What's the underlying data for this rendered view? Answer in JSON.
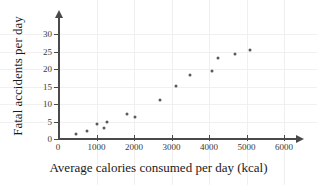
{
  "chart_data": {
    "type": "scatter",
    "title": "",
    "xlabel": "Average calories consumed per day (kcal)",
    "ylabel": "Fatal accidents per day",
    "xlim": [
      0,
      6400
    ],
    "ylim": [
      0,
      32
    ],
    "grid": true,
    "legend": null,
    "x_ticks": [
      0,
      1000,
      2000,
      3000,
      4000,
      5000,
      6000
    ],
    "x_tick_labels": [
      "0",
      "1000",
      "2000",
      "3000",
      "4000",
      "5000",
      "6000"
    ],
    "y_ticks": [
      0,
      5,
      10,
      15,
      20,
      25,
      30
    ],
    "y_tick_labels": [
      "0",
      "5",
      "10",
      "15",
      "20",
      "25",
      "30"
    ],
    "marker_color": "#5a5a5a",
    "axis_color": "#4a4a4a",
    "grid_color": "#f0f0f0",
    "background_color": "#ffffff",
    "points": [
      {
        "x": 450,
        "y": 1.3
      },
      {
        "x": 750,
        "y": 2.2
      },
      {
        "x": 1000,
        "y": 4.2
      },
      {
        "x": 1200,
        "y": 3.1
      },
      {
        "x": 1280,
        "y": 4.9
      },
      {
        "x": 1820,
        "y": 7.1
      },
      {
        "x": 2020,
        "y": 6.2
      },
      {
        "x": 2700,
        "y": 11.2
      },
      {
        "x": 3120,
        "y": 15.1
      },
      {
        "x": 3500,
        "y": 18.2
      },
      {
        "x": 4080,
        "y": 19.3
      },
      {
        "x": 4250,
        "y": 23.2
      },
      {
        "x": 4700,
        "y": 24.2
      },
      {
        "x": 5080,
        "y": 25.3
      }
    ]
  }
}
